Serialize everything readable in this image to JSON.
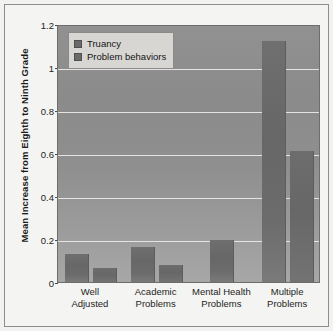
{
  "chart_data": {
    "type": "bar",
    "title": "",
    "subtitle": "",
    "xlabel": "",
    "ylabel": "Mean Increase from Eighth to Ninth Grade",
    "ylim": [
      0,
      1.2
    ],
    "yticks": [
      "0",
      "0.2",
      "0.4",
      "0.6",
      "0.8",
      "1",
      "1.2"
    ],
    "ytick_values": [
      0,
      0.2,
      0.4,
      0.6,
      0.8,
      1,
      1.2
    ],
    "grid": true,
    "legend_position": "top-left",
    "categories": [
      "Well Adjusted",
      "Academic Problems",
      "Mental Health Problems",
      "Multiple Problems"
    ],
    "category_lines": [
      [
        "Well",
        "Adjusted"
      ],
      [
        "Academic",
        "Problems"
      ],
      [
        "Mental Health",
        "Problems"
      ],
      [
        "Multiple",
        "Problems"
      ]
    ],
    "series": [
      {
        "name": "Truancy",
        "color": "#6a6a6a",
        "values": [
          0.13,
          0.165,
          0.195,
          1.12
        ]
      },
      {
        "name": "Problem behaviors",
        "color": "#6a6a6a",
        "values": [
          0.065,
          0.08,
          null,
          0.61
        ]
      }
    ]
  },
  "legend": {
    "items": [
      {
        "label": "Truancy"
      },
      {
        "label": "Problem behaviors"
      }
    ]
  },
  "colors": {
    "plot_background": "#909090",
    "gridline": "#eceae6",
    "bar": "#6a6a6a",
    "figure_background": "#f4f4f2",
    "frame": "#8d8d8d",
    "text": "#1b1b1b"
  }
}
